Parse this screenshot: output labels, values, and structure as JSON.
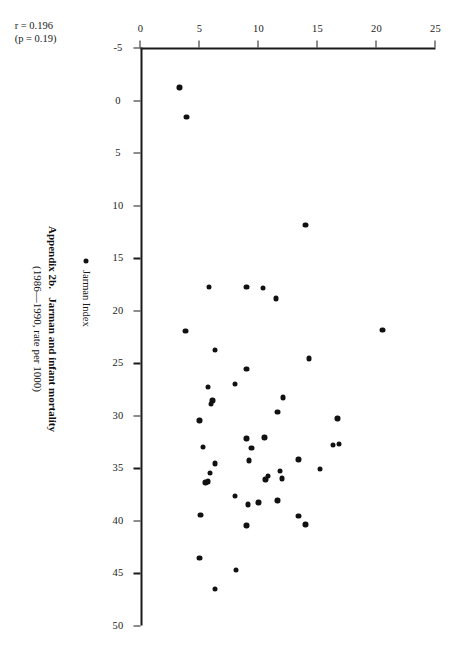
{
  "figure": {
    "caption_label": "Appendix 2b.",
    "caption_title": "Jarman and infant mortality",
    "caption_sub": "(1986—1990, rate per 1000)",
    "stats_r": "r = 0.196",
    "stats_p": "(p = 0.19)",
    "legend_label": "Jarman Index",
    "legend_marker": "filled-circle",
    "marker_color": "#111111",
    "axis_color": "#1a1a1a",
    "background": "#ffffff"
  },
  "chart_data": {
    "type": "scatter",
    "subtitle": "(1986—1990, rate per 1000)",
    "xlabel": "",
    "ylabel": "",
    "xlim": [
      -5,
      50
    ],
    "ylim": [
      0,
      25
    ],
    "xticks": [
      -5,
      0,
      5,
      10,
      15,
      20,
      25,
      30,
      35,
      40,
      45,
      50
    ],
    "xtick_labels": [
      "-5",
      "0",
      "5",
      "10",
      "15",
      "20",
      "25",
      "30",
      "35",
      "40",
      "45",
      "50"
    ],
    "yticks": [
      0,
      5,
      10,
      15,
      20,
      25
    ],
    "ytick_labels": [
      "0",
      "5",
      "10",
      "15",
      "20",
      "25"
    ],
    "grid": false,
    "legend_position": "below-right",
    "series": [
      {
        "name": "Jarman Index",
        "marker": "filled-circle",
        "color": "#111111",
        "points": [
          [
            -1.2,
            3.3
          ],
          [
            1.6,
            3.9
          ],
          [
            11.9,
            14.0
          ],
          [
            17.8,
            9.0
          ],
          [
            17.8,
            5.8
          ],
          [
            17.9,
            10.4
          ],
          [
            18.9,
            11.5
          ],
          [
            21.9,
            20.5
          ],
          [
            22.0,
            3.8
          ],
          [
            23.8,
            6.3
          ],
          [
            24.6,
            14.3
          ],
          [
            25.6,
            9.0
          ],
          [
            27.0,
            8.0
          ],
          [
            27.3,
            5.7
          ],
          [
            28.3,
            12.1
          ],
          [
            28.6,
            6.1
          ],
          [
            28.9,
            6.0
          ],
          [
            29.7,
            11.6
          ],
          [
            30.3,
            16.7
          ],
          [
            30.5,
            5.0
          ],
          [
            32.1,
            10.5
          ],
          [
            32.2,
            9.0
          ],
          [
            32.7,
            16.8
          ],
          [
            32.8,
            16.3
          ],
          [
            33.0,
            5.3
          ],
          [
            33.1,
            9.4
          ],
          [
            34.2,
            13.4
          ],
          [
            34.3,
            9.2
          ],
          [
            34.6,
            6.3
          ],
          [
            35.1,
            15.2
          ],
          [
            35.3,
            11.8
          ],
          [
            35.5,
            5.9
          ],
          [
            35.8,
            10.8
          ],
          [
            36.0,
            12.0
          ],
          [
            36.1,
            10.6
          ],
          [
            36.3,
            5.7
          ],
          [
            36.4,
            5.5
          ],
          [
            37.7,
            8.0
          ],
          [
            38.1,
            11.6
          ],
          [
            38.3,
            10.0
          ],
          [
            38.5,
            9.1
          ],
          [
            39.5,
            5.1
          ],
          [
            39.6,
            13.4
          ],
          [
            40.4,
            14.0
          ],
          [
            40.5,
            9.0
          ],
          [
            43.6,
            5.0
          ],
          [
            44.7,
            8.1
          ],
          [
            46.5,
            6.3
          ]
        ]
      }
    ],
    "annotations": [
      {
        "text": "r = 0.196",
        "position": "lower-left"
      },
      {
        "text": "(p = 0.19)",
        "position": "lower-left"
      }
    ]
  }
}
